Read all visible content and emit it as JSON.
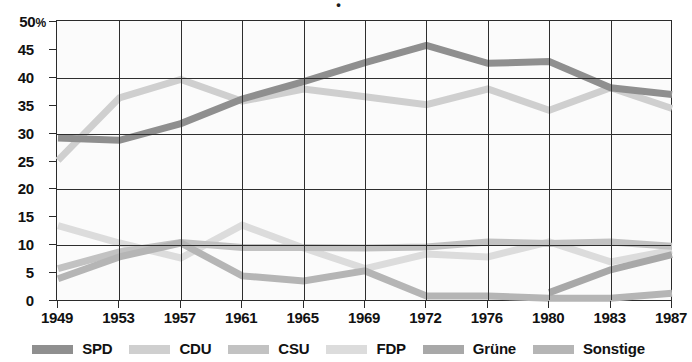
{
  "title_fragment": "•",
  "axes": {
    "y_unit": "%",
    "y_ticks": [
      "50",
      "45",
      "40",
      "35",
      "30",
      "25",
      "20",
      "15",
      "10",
      "5",
      "0"
    ],
    "y_min": 0,
    "y_max": 50,
    "y_gridlines": [
      10,
      20,
      30,
      40
    ],
    "x_ticks": [
      "1949",
      "1953",
      "1957",
      "1961",
      "1965",
      "1969",
      "1972",
      "1976",
      "1980",
      "1983",
      "1987"
    ]
  },
  "legend": {
    "items": [
      {
        "label": "SPD",
        "color": "#8f8f8f"
      },
      {
        "label": "CDU",
        "color": "#cfcfcf"
      },
      {
        "label": "CSU",
        "color": "#c2c2c2"
      },
      {
        "label": "FDP",
        "color": "#dcdcdc"
      },
      {
        "label": "Grüne",
        "color": "#a8a8a8"
      },
      {
        "label": "Sonstige",
        "color": "#b5b5b5"
      }
    ]
  },
  "chart_data": {
    "type": "line",
    "title": "",
    "xlabel": "",
    "ylabel": "%",
    "ylim": [
      0,
      50
    ],
    "grid": true,
    "legend_position": "bottom",
    "categories": [
      "1949",
      "1953",
      "1957",
      "1961",
      "1965",
      "1969",
      "1972",
      "1976",
      "1980",
      "1983",
      "1987"
    ],
    "series": [
      {
        "name": "SPD",
        "color": "#8f8f8f",
        "values": [
          29.2,
          28.8,
          31.8,
          36.2,
          39.3,
          42.7,
          45.8,
          42.6,
          42.9,
          38.2,
          37.0
        ]
      },
      {
        "name": "CDU",
        "color": "#cfcfcf",
        "values": [
          25.2,
          36.4,
          39.7,
          35.8,
          38.0,
          36.6,
          35.2,
          38.0,
          34.2,
          38.2,
          34.5
        ]
      },
      {
        "name": "CSU",
        "color": "#c2c2c2",
        "values": [
          5.8,
          8.8,
          10.5,
          9.6,
          9.6,
          9.5,
          9.7,
          10.6,
          10.3,
          10.6,
          9.8
        ]
      },
      {
        "name": "FDP",
        "color": "#dcdcdc",
        "values": [
          13.5,
          10.4,
          7.7,
          13.6,
          9.5,
          5.8,
          8.4,
          7.9,
          10.6,
          7.0,
          9.1
        ]
      },
      {
        "name": "Grüne",
        "color": "#a8a8a8",
        "values": [
          0.0,
          0.0,
          0.0,
          0.0,
          0.0,
          0.0,
          0.0,
          0.0,
          1.5,
          5.6,
          8.3
        ]
      },
      {
        "name": "Sonstige",
        "color": "#b5b5b5",
        "values": [
          4.0,
          7.9,
          10.4,
          4.5,
          3.6,
          5.4,
          0.9,
          0.9,
          0.5,
          0.5,
          1.4
        ]
      }
    ]
  }
}
